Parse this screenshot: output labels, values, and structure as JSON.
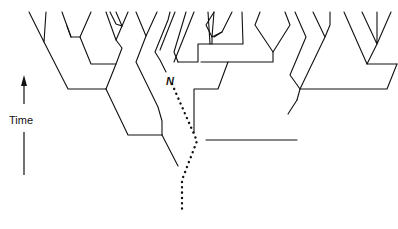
{
  "diagram": {
    "type": "genealogical tree (coalescent)",
    "axis": {
      "label": "Time",
      "direction": "up"
    },
    "labels": {
      "node": "N"
    },
    "colors": {
      "line": "#111111",
      "background": "#ffffff"
    }
  }
}
